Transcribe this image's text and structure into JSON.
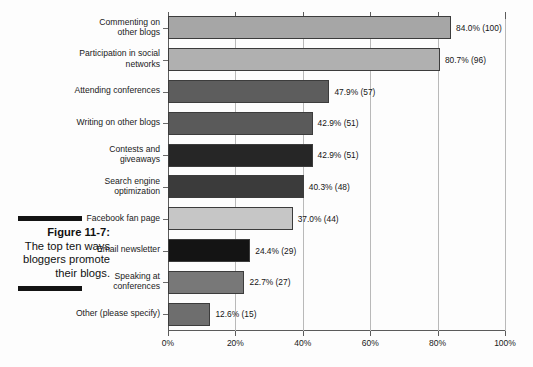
{
  "figure": {
    "number_label": "Figure 11-7:",
    "caption": "The top ten ways bloggers promote their blogs."
  },
  "chart_data": {
    "type": "bar",
    "orientation": "horizontal",
    "title": "",
    "xlabel": "",
    "ylabel": "",
    "xlim": [
      0,
      100
    ],
    "grid": true,
    "legend": "none",
    "xticks": [
      "0%",
      "20%",
      "40%",
      "60%",
      "80%",
      "100%"
    ],
    "xtick_values": [
      0,
      20,
      40,
      60,
      80,
      100
    ],
    "categories": [
      "Commenting on\nother blogs",
      "Participation in social\nnetworks",
      "Attending conferences",
      "Writing on other blogs",
      "Contests and\ngiveaways",
      "Search engine\noptimization",
      "Facebook fan page",
      "Email newsletter",
      "Speaking at\nconferences",
      "Other (please specify)"
    ],
    "values": [
      84.0,
      80.7,
      47.9,
      42.9,
      42.9,
      40.3,
      37.0,
      24.4,
      22.7,
      12.6
    ],
    "counts": [
      100,
      96,
      57,
      51,
      51,
      48,
      44,
      29,
      27,
      15
    ],
    "data_labels": [
      "84.0% (100)",
      "80.7% (96)",
      "47.9% (57)",
      "42.9% (51)",
      "42.9% (51)",
      "40.3% (48)",
      "37.0% (44)",
      "24.4% (29)",
      "22.7% (27)",
      "12.6% (15)"
    ],
    "bar_colors": [
      "#a6a6a6",
      "#b0b0b0",
      "#5d5d5d",
      "#5a5a5a",
      "#262626",
      "#3b3b3b",
      "#c6c6c6",
      "#141414",
      "#787878",
      "#6e6e6e"
    ]
  }
}
